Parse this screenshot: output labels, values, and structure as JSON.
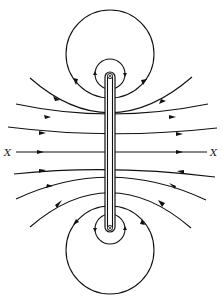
{
  "diagram": {
    "labels": {
      "axis_left": "X",
      "axis_right": "X"
    },
    "colors": {
      "stroke": "#111111",
      "background": "#ffffff"
    },
    "elements": {
      "rod": "vertical conductor with circular ends",
      "top_large_loop": "closed field loop around upper end",
      "top_small_loop": "small closed loop around upper end",
      "bottom_large_loop": "closed field loop around lower end",
      "bottom_small_loop": "small closed loop around lower end",
      "field_lines_above_axis": 3,
      "field_lines_below_axis": 3,
      "axis_line": "X–X"
    }
  }
}
